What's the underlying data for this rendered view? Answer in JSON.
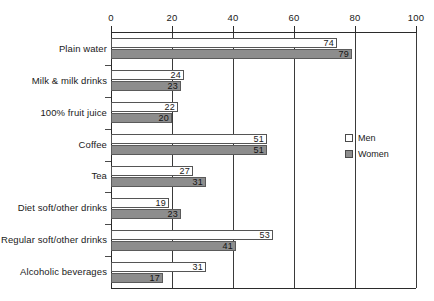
{
  "chart_data": {
    "type": "bar",
    "orientation": "horizontal",
    "title": "",
    "xlabel": "",
    "ylabel": "",
    "xlim": [
      0,
      100
    ],
    "xticks": [
      0,
      20,
      40,
      60,
      80,
      100
    ],
    "xtick_labels": [
      "0",
      "20",
      "40",
      "60",
      "80",
      "100"
    ],
    "grid": true,
    "grid_axis": "x",
    "axis_position": "top",
    "legend_position": "right-middle",
    "categories": [
      "Plain water",
      "Milk & milk drinks",
      "100% fruit juice",
      "Coffee",
      "Tea",
      "Diet soft/other drinks",
      "Regular soft/other drinks",
      "Alcoholic beverages"
    ],
    "series": [
      {
        "name": "Men",
        "color": "#ffffff",
        "values": [
          74,
          24,
          22,
          51,
          27,
          19,
          53,
          31
        ],
        "value_labels": [
          "74",
          "24",
          "22",
          "51",
          "27",
          "19",
          "53",
          "31"
        ]
      },
      {
        "name": "Women",
        "color": "#8d8d8d",
        "values": [
          79,
          23,
          20,
          51,
          31,
          23,
          41,
          17
        ],
        "value_labels": [
          "79",
          "23",
          "20",
          "51",
          "31",
          "23",
          "41",
          "17"
        ]
      }
    ]
  },
  "legend": {
    "items": [
      {
        "label": "Men",
        "swatch": "men-swatch"
      },
      {
        "label": "Women",
        "swatch": "women-swatch"
      }
    ]
  },
  "colors": {
    "men_fill": "#ffffff",
    "women_fill": "#8d8d8d",
    "axis": "#2b2b2b",
    "text": "#1a1a1a",
    "background": "#ffffff"
  }
}
